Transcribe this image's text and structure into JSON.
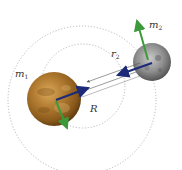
{
  "diagram": {
    "labels": {
      "m1": "m",
      "m1_sub": "1",
      "m2": "m",
      "m2_sub": "2",
      "r2": "r",
      "r2_sub": "2",
      "R": "R"
    },
    "bodies": [
      {
        "name": "m1",
        "kind": "planet",
        "color": "#a0702a"
      },
      {
        "name": "m2",
        "kind": "moon",
        "color": "#8a8a8a"
      }
    ],
    "arrows": {
      "force_color": "#1c2a78",
      "velocity_color": "#3d9a3a"
    },
    "orbits": {
      "style": "dotted",
      "color": "#a8a8a8"
    }
  }
}
